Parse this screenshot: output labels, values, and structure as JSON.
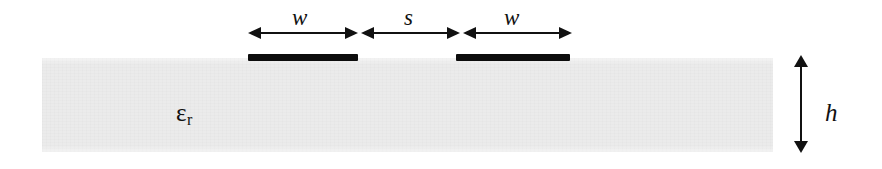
{
  "figure": {
    "kind": "cross-section-diagram",
    "background_color": "#ffffff"
  },
  "substrate": {
    "label_symbol": "ε",
    "label_subscript": "r",
    "fill_color": "#ebebeb",
    "geometry": {
      "x": 42,
      "y": 58,
      "width": 731,
      "height": 94
    }
  },
  "conductors": [
    {
      "name": "left-strip",
      "color": "#0d0d0d",
      "geometry": {
        "x": 248,
        "y": 54,
        "width": 110,
        "height": 7
      }
    },
    {
      "name": "right-strip",
      "color": "#0d0d0d",
      "geometry": {
        "x": 456,
        "y": 54,
        "width": 114,
        "height": 7
      }
    }
  ],
  "dimensions": [
    {
      "name": "width-left",
      "label": "w",
      "orientation": "horizontal",
      "line": {
        "x1": 248,
        "x2": 358,
        "y": 33
      }
    },
    {
      "name": "separation",
      "label": "s",
      "orientation": "horizontal",
      "line": {
        "x1": 361,
        "x2": 460,
        "y": 33
      }
    },
    {
      "name": "width-right",
      "label": "w",
      "orientation": "horizontal",
      "line": {
        "x1": 463,
        "x2": 572,
        "y": 33
      }
    },
    {
      "name": "substrate-height",
      "label": "h",
      "orientation": "vertical",
      "line": {
        "x": 801,
        "y1": 57,
        "y2": 152
      }
    }
  ],
  "colors": {
    "ink": "#111111",
    "metal": "#0d0d0d",
    "dielectric": "#ebebeb"
  }
}
